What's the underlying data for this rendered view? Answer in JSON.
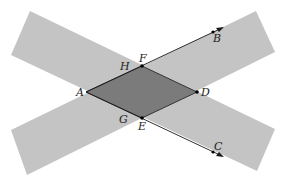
{
  "diagram": {
    "colors": {
      "background": "#ffffff",
      "strip": "#c4c4c4",
      "overlap": "#7b7b7b",
      "line": "#1a1a1a"
    },
    "points": {
      "A": {
        "label": "A",
        "x": 86,
        "y": 92
      },
      "F": {
        "label": "F",
        "x": 142,
        "y": 66
      },
      "D": {
        "label": "D",
        "x": 197,
        "y": 92
      },
      "E": {
        "label": "E",
        "x": 142,
        "y": 118
      },
      "B": {
        "label": "B",
        "x": 214,
        "y": 32
      },
      "C": {
        "label": "C",
        "x": 214,
        "y": 152
      },
      "H": {
        "label": "H"
      },
      "G": {
        "label": "G"
      }
    },
    "rays": [
      {
        "from": "A",
        "through": "F",
        "to": "B"
      },
      {
        "from": "A",
        "through": "E",
        "to": "C"
      }
    ],
    "strips": [
      {
        "name": "strip-descending",
        "direction": "upper-left to lower-right"
      },
      {
        "name": "strip-ascending",
        "direction": "lower-left to upper-right"
      }
    ]
  }
}
